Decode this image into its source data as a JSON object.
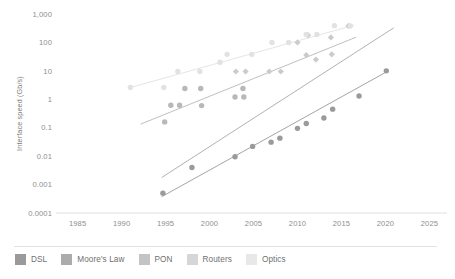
{
  "chart_data": {
    "type": "scatter",
    "title": "",
    "xlabel": "",
    "ylabel": "Interface speed (Gb/s)",
    "yscale": "log",
    "ylim": [
      0.0001,
      1000
    ],
    "xlim": [
      1983,
      2027
    ],
    "grid": false,
    "legend_position": "bottom",
    "y_ticks": [
      "1,000",
      "100",
      "10",
      "1",
      "0.1",
      "0.01",
      "0.001",
      "0.0001"
    ],
    "y_tick_values": [
      1000,
      100,
      10,
      1,
      0.1,
      0.01,
      0.001,
      0.0001
    ],
    "x_ticks": [
      "1985",
      "1990",
      "1995",
      "2000",
      "2005",
      "2010",
      "2015",
      "2020",
      "2025"
    ],
    "x_tick_values": [
      1985,
      1990,
      1995,
      2000,
      2005,
      2010,
      2015,
      2020,
      2025
    ],
    "series": [
      {
        "name": "DSL",
        "color": "#9a9a9a",
        "marker": "circle",
        "points": [
          {
            "x": 1994.7,
            "y": 0.0005
          },
          {
            "x": 1998.0,
            "y": 0.004
          },
          {
            "x": 2002.9,
            "y": 0.0095
          },
          {
            "x": 2004.9,
            "y": 0.022
          },
          {
            "x": 2007.0,
            "y": 0.031
          },
          {
            "x": 2008.0,
            "y": 0.043
          },
          {
            "x": 2010.0,
            "y": 0.095
          },
          {
            "x": 2011.0,
            "y": 0.14
          },
          {
            "x": 2013.0,
            "y": 0.22
          },
          {
            "x": 2014.0,
            "y": 0.45
          },
          {
            "x": 2017.0,
            "y": 1.3
          },
          {
            "x": 2020.1,
            "y": 10.0
          }
        ],
        "trend": {
          "x0": 1994.6,
          "y0": 0.00038,
          "x1": 2020.2,
          "y1": 9.5
        }
      },
      {
        "name": "Moore's Law",
        "color": "#a8a8a8",
        "marker": "line",
        "points": [],
        "trend": {
          "x0": 1994.6,
          "y0": 0.0018,
          "x1": 2020.9,
          "y1": 320.0
        }
      },
      {
        "name": "PON",
        "color": "#b8b8b8",
        "marker": "circle",
        "points": [
          {
            "x": 1994.9,
            "y": 0.16
          },
          {
            "x": 1995.6,
            "y": 0.62
          },
          {
            "x": 1996.6,
            "y": 0.62
          },
          {
            "x": 1997.2,
            "y": 2.4
          },
          {
            "x": 1999.0,
            "y": 2.4
          },
          {
            "x": 1999.1,
            "y": 0.6
          },
          {
            "x": 2002.9,
            "y": 1.2
          },
          {
            "x": 2003.8,
            "y": 2.4
          },
          {
            "x": 2003.9,
            "y": 1.2
          }
        ],
        "trend": {
          "x0": 1992.2,
          "y0": 0.135,
          "x1": 2016.6,
          "y1": 150.0
        }
      },
      {
        "name": "Routers",
        "color": "#cbcbcb",
        "marker": "diamond",
        "points": [
          {
            "x": 2003.0,
            "y": 9.5
          },
          {
            "x": 2004.1,
            "y": 9.5
          },
          {
            "x": 2006.8,
            "y": 9.5
          },
          {
            "x": 2008.1,
            "y": 9.5
          },
          {
            "x": 2010.0,
            "y": 100.0
          },
          {
            "x": 2011.0,
            "y": 36.0
          },
          {
            "x": 2011.2,
            "y": 180.0
          },
          {
            "x": 2012.1,
            "y": 25.0
          },
          {
            "x": 2013.9,
            "y": 38.0
          },
          {
            "x": 2013.8,
            "y": 150.0
          },
          {
            "x": 2015.8,
            "y": 380.0
          }
        ],
        "trend": {
          "x0": 1992.2,
          "y0": 0.135,
          "x1": 2016.6,
          "y1": 150.0
        }
      },
      {
        "name": "Optics",
        "color": "#e2e2e2",
        "marker": "circle",
        "points": [
          {
            "x": 1991.0,
            "y": 2.6
          },
          {
            "x": 1994.8,
            "y": 2.6
          },
          {
            "x": 1996.4,
            "y": 9.5
          },
          {
            "x": 1998.9,
            "y": 9.5
          },
          {
            "x": 2001.2,
            "y": 20.0
          },
          {
            "x": 2002.0,
            "y": 38.0
          },
          {
            "x": 2004.8,
            "y": 38.0
          },
          {
            "x": 2007.1,
            "y": 100.0
          },
          {
            "x": 2009.0,
            "y": 100.0
          },
          {
            "x": 2011.0,
            "y": 190.0
          },
          {
            "x": 2012.2,
            "y": 190.0
          },
          {
            "x": 2014.2,
            "y": 390.0
          },
          {
            "x": 2016.0,
            "y": 380.0
          }
        ],
        "trend": {
          "x0": 1991.0,
          "y0": 2.6,
          "x1": 2016.4,
          "y1": 400.0
        }
      }
    ]
  },
  "legend": {
    "items": [
      {
        "label": "DSL",
        "color": "#9a9a9a"
      },
      {
        "label": "Moore's Law",
        "color": "#acacac"
      },
      {
        "label": "PON",
        "color": "#c4c4c4"
      },
      {
        "label": "Routers",
        "color": "#d6d6d6"
      },
      {
        "label": "Optics",
        "color": "#e8e8e8"
      }
    ]
  }
}
